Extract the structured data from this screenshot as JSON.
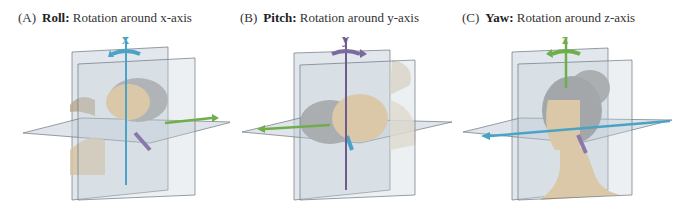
{
  "figure": {
    "panels": [
      {
        "letter": "(A)",
        "title": "Roll:",
        "desc": "Rotation around x-axis",
        "axis_label": "x",
        "axis_color": "#4aa3c4",
        "secondary_axes": [
          {
            "name": "y",
            "color": "#6fae4a"
          },
          {
            "name": "z",
            "color": "#8a78ad"
          }
        ],
        "head_orientation": "lying on back (rotated)"
      },
      {
        "letter": "(B)",
        "title": "Pitch:",
        "desc": "Rotation around y-axis",
        "axis_label": "y",
        "axis_color": "#7a6a9e",
        "secondary_axes": [
          {
            "name": "x",
            "color": "#6fae4a"
          },
          {
            "name": "z",
            "color": "#4aa3c4"
          }
        ],
        "head_orientation": "tilted sideways (rotated)"
      },
      {
        "letter": "(C)",
        "title": "Yaw:",
        "desc": "Rotation around z-axis",
        "axis_label": "z",
        "axis_color": "#6fae4a",
        "secondary_axes": [
          {
            "name": "x",
            "color": "#4aa3c4"
          },
          {
            "name": "y",
            "color": "#8a78ad"
          }
        ],
        "head_orientation": "profile view"
      }
    ],
    "colors": {
      "plane_fill": "#c9d3dc",
      "plane_stroke": "#6b7680",
      "skin": "#e3c28e",
      "hair": "#8d8d8d"
    }
  }
}
